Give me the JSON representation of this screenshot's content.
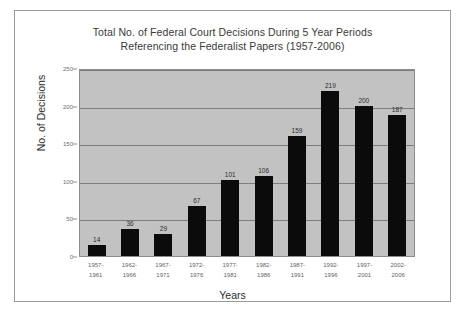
{
  "chart_data": {
    "type": "bar",
    "title": "Total No. of Federal Court Decisions During 5 Year Periods Referencing the Federalist Papers (1957-2006)",
    "title_line1": "Total No. of Federal Court Decisions During 5 Year Periods",
    "title_line2": "Referencing the Federalist Papers (1957-2006)",
    "xlabel": "Years",
    "ylabel": "No. of Decisions",
    "ylim": [
      0,
      250
    ],
    "yticks": [
      0,
      50,
      100,
      150,
      200,
      250
    ],
    "grid": true,
    "legend": "none",
    "plot_background": "#c2c2c2",
    "bar_color": "#0b0b0b",
    "categories": [
      "1957-1961",
      "1962-1966",
      "1967-1971",
      "1972-1976",
      "1977-1981",
      "1982-1986",
      "1987-1991",
      "1992-1996",
      "1997-2001",
      "2002-2006"
    ],
    "category_lines": [
      [
        "1957-",
        "1961"
      ],
      [
        "1962-",
        "1966"
      ],
      [
        "1967-",
        "1971"
      ],
      [
        "1972-",
        "1976"
      ],
      [
        "1977-",
        "1981"
      ],
      [
        "1982-",
        "1986"
      ],
      [
        "1987-",
        "1991"
      ],
      [
        "1992-",
        "1996"
      ],
      [
        "1997-",
        "2001"
      ],
      [
        "2002-",
        "2006"
      ]
    ],
    "values": [
      14,
      36,
      29,
      67,
      101,
      106,
      159,
      219,
      200,
      187
    ]
  }
}
